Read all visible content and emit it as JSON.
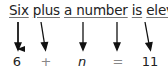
{
  "sentence": {
    "words": [
      "Six",
      "plus",
      "a number",
      "is",
      "eleven"
    ],
    "period": "."
  },
  "equation": {
    "symbols": [
      "6",
      "+",
      "n",
      "=",
      "11"
    ]
  },
  "colors": {
    "text": "#222222",
    "operator": "#888888",
    "arrow": "#111111"
  }
}
